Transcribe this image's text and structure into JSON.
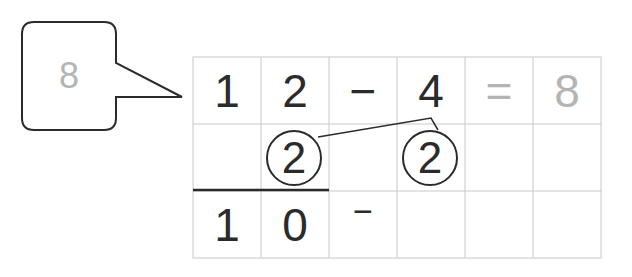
{
  "callout": {
    "value": "8"
  },
  "grid": {
    "rows": 3,
    "cols": 6,
    "row1": [
      "1",
      "2",
      "−",
      "4",
      "=",
      "8"
    ],
    "row2": {
      "circled_left": "2",
      "circled_right": "2"
    },
    "row3": [
      "1",
      "0",
      "−",
      "",
      "",
      ""
    ]
  },
  "colors": {
    "ink": "#2b2b2b",
    "answer_gray": "#b4b4b4",
    "grid_line": "#c8c8c8"
  }
}
